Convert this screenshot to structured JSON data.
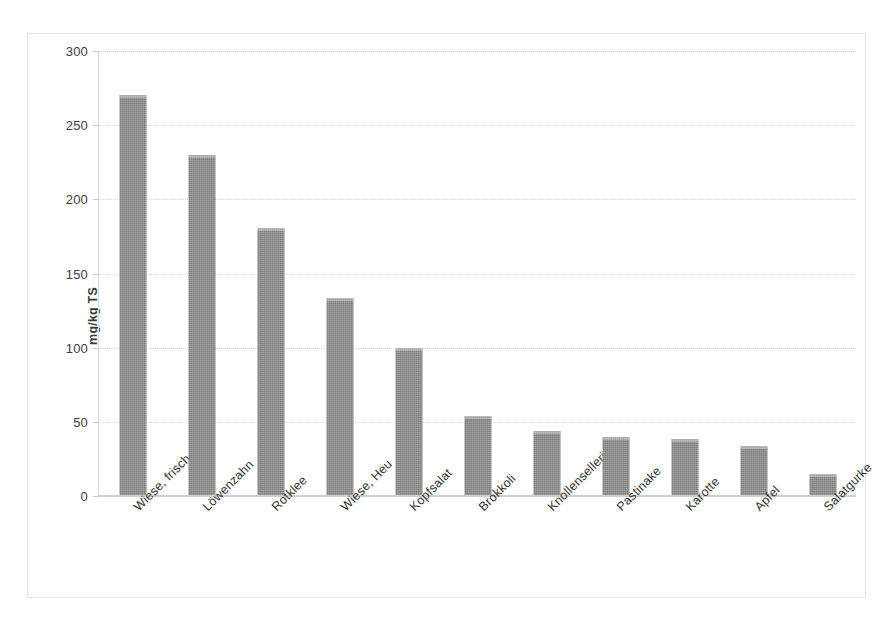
{
  "chart_data": {
    "type": "bar",
    "title": "",
    "xlabel": "",
    "ylabel": "mg/kg TS",
    "ylim": [
      0,
      300
    ],
    "ytick_labels": [
      "300",
      "250",
      "200",
      "150",
      "100",
      "50",
      "0"
    ],
    "yticks": [
      300,
      250,
      200,
      150,
      100,
      50,
      0
    ],
    "grid": true,
    "legend": "none",
    "bar_color": "#8c8c8c",
    "categories": [
      "Wiese, frisch",
      "Löwenzahn",
      "Rotklee",
      "Wiese, Heu",
      "Kopfsalat",
      "Brokkoli",
      "Knollensellerie",
      "Pastinake",
      "Karotte",
      "Apfel",
      "Salatgurke"
    ],
    "values": [
      270,
      229,
      180,
      133,
      99,
      53,
      43,
      39,
      38,
      33,
      14
    ]
  }
}
